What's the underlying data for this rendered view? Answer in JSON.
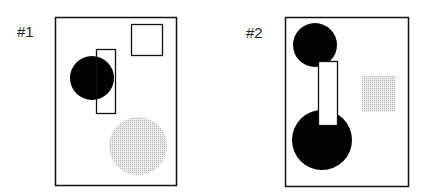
{
  "panels": [
    {
      "label": "#1"
    },
    {
      "label": "#2"
    }
  ],
  "colors": {
    "outline": "#111111",
    "fill_black": "#000000",
    "fill_gray": "#d4d4d4"
  }
}
